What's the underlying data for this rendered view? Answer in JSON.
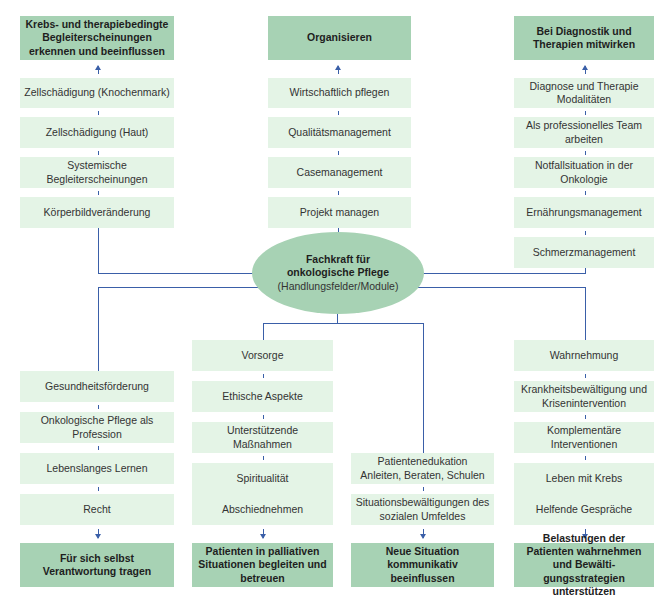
{
  "center": {
    "title": "Fachkraft für onkologische Pflege",
    "subtitle": "(Handlungsfelder/Module)"
  },
  "top": [
    {
      "header": "Krebs- und therapiebedingte Begleiterscheinungen erkennen und beeinflussen",
      "items": [
        "Zellschädigung (Knochenmark)",
        "Zellschädigung (Haut)",
        "Systemische Begleiterscheinungen",
        "Körperbildveränderung"
      ]
    },
    {
      "header": "Organisieren",
      "items": [
        "Wirtschaftlich pflegen",
        "Qualitätsmanagement",
        "Casemanagement",
        "Projekt managen"
      ]
    },
    {
      "header": "Bei Diagnostik und Therapien mitwirken",
      "items": [
        "Diagnose und Therapie Modalitäten",
        "Als professionelles Team arbeiten",
        "Notfallsituation in der Onkologie",
        "Ernährungsmanagement",
        "Schmerzmanagement"
      ]
    }
  ],
  "bottom": [
    {
      "header": "Für sich selbst Verantwortung tragen",
      "items": [
        "Gesundheitsförderung",
        "Onkologische Pflege als Profession",
        "Lebenslanges Lernen",
        "Recht"
      ]
    },
    {
      "header": "Patienten in palliativen Situationen begleiten und betreuen",
      "items": [
        "Vorsorge",
        "Ethische Aspekte",
        "Unterstützende Maßnahmen",
        "Spiritualität",
        "Abschiednehmen"
      ]
    },
    {
      "header": "Neue Situation kommunikativ beeinflussen",
      "items": [
        "Patientenedukation Anleiten, Beraten, Schulen",
        "Situationsbewältigungen des sozialen Umfeldes"
      ]
    },
    {
      "header": "Belastungen der Patienten wahrnehmen und Bewälti­gungsstrategien unterstützen",
      "items": [
        "Wahrnehmung",
        "Krankheitsbewältigung und Krisenintervention",
        "Komplementäre Interventionen",
        "Leben mit Krebs",
        "Helfende Gespräche"
      ]
    }
  ],
  "colors": {
    "header_fill": "#a7d2b4",
    "item_fill": "#e4f4e6",
    "connector": "#3a5fa8"
  }
}
